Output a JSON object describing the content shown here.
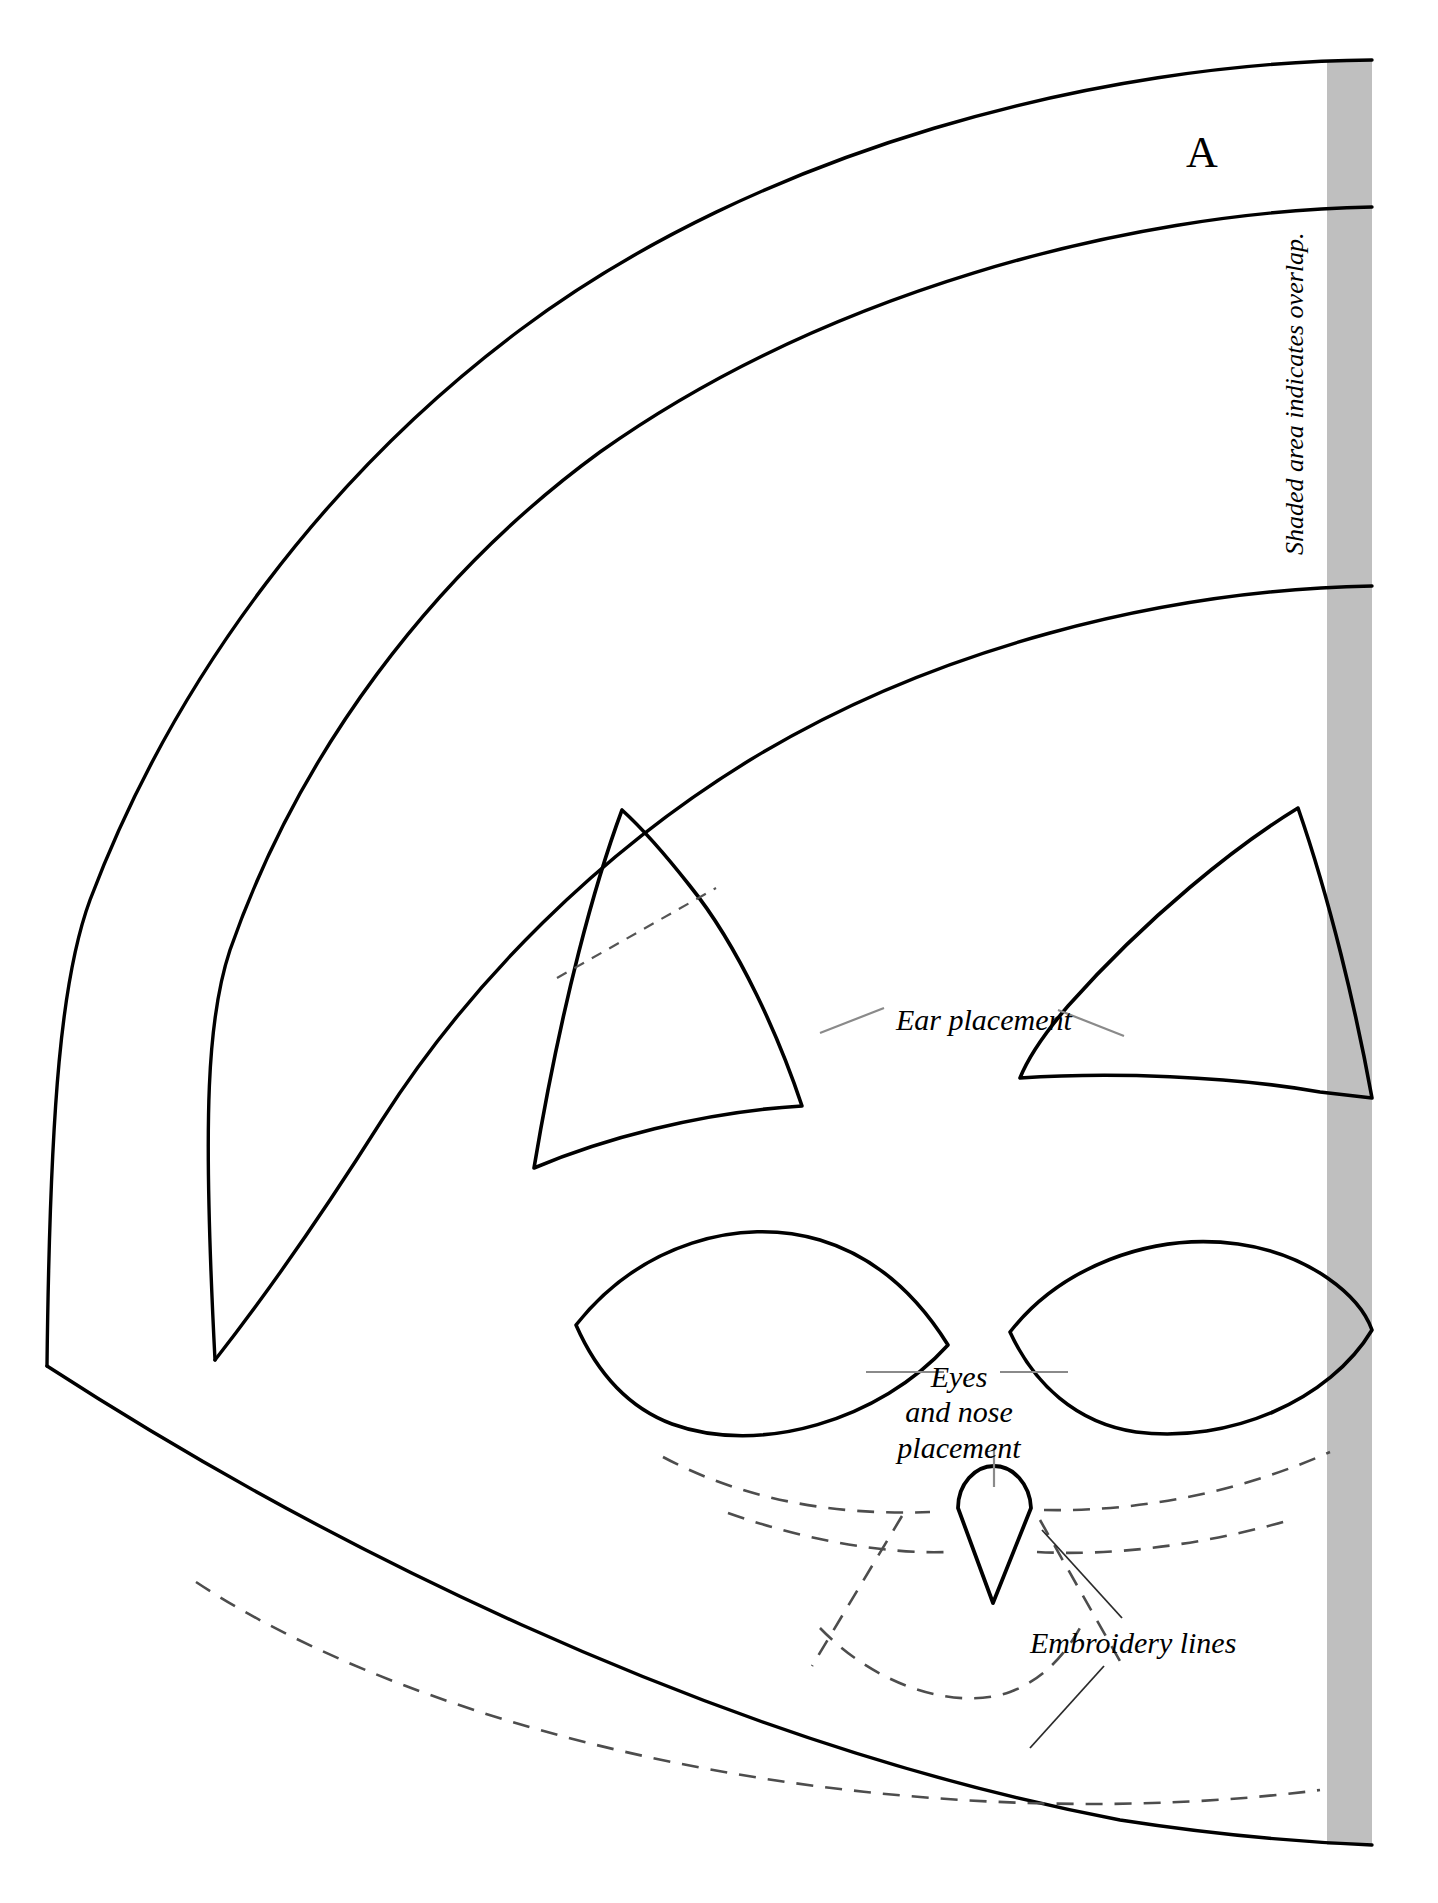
{
  "document": {
    "type": "sewing-pattern-sheet",
    "title_letter": "A",
    "width_px": 1438,
    "height_px": 1903
  },
  "colors": {
    "ink": "#000000",
    "paper": "#ffffff",
    "shaded_overlap": "#bfbfbf",
    "leader_line": "#808080",
    "dashed_stitch": "#4d4d4d"
  },
  "annotations": {
    "piece_letter": "A",
    "overlap_note": "Shaded area indicates overlap.",
    "ear_placement": "Ear placement",
    "eyes_nose_placement_line1": "Eyes",
    "eyes_nose_placement_line2": "and nose",
    "eyes_nose_placement_line3": "placement",
    "embroidery_lines": "Embroidery lines"
  },
  "shapes": {
    "outer_arc": "outer-cutting-arc",
    "middle_arc": "middle-seam-arc",
    "inner_arc": "inner-placement-arc",
    "bottom_arc": "bottom-edge-arc",
    "left_ear": "left-ear-outline",
    "right_ear": "right-ear-outline",
    "left_eye": "left-eye-outline",
    "right_eye": "right-eye-outline",
    "nose": "nose-outline",
    "overlap_strip": "overlap-shaded-strip"
  }
}
